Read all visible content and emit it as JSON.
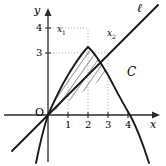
{
  "figure": {
    "type": "analytic-geometry-diagram"
  },
  "axes": {
    "x_axis_label": "x",
    "y_axis_label": "y",
    "origin_label": "O",
    "x_ticks": [
      "1",
      "2",
      "3",
      "4"
    ],
    "y_ticks": [
      "3",
      "4"
    ],
    "x_range": [
      -2.5,
      5.5
    ],
    "y_range": [
      -2.5,
      5.5
    ],
    "unit_px": 20,
    "origin_px": [
      48,
      115
    ]
  },
  "curves": [
    {
      "name_label": "C",
      "kind": "parabola",
      "equation": "y = 4x - x^2",
      "vertex": [
        2,
        4
      ],
      "roots": [
        0,
        4
      ],
      "label_pos_px": [
        129,
        72
      ],
      "color": "#1a1a1a"
    },
    {
      "name_label": "ℓ",
      "kind": "line",
      "equation": "y = x",
      "through": [
        [
          0,
          0
        ],
        [
          3,
          3
        ]
      ],
      "label_pos_px": [
        138,
        6
      ],
      "color": "#1a1a1a"
    }
  ],
  "points": [
    {
      "label": "x",
      "sub": "1",
      "value": 0,
      "label_pos_px": [
        57,
        26
      ]
    },
    {
      "label": "x",
      "sub": "2",
      "value": 3,
      "label_pos_px": [
        107,
        30
      ]
    }
  ],
  "shaded_region": {
    "fill_style": "diagonal-hatch",
    "between": [
      "y = 4x - x^2",
      "y = x"
    ],
    "from_x": 0,
    "to_x": 3,
    "hatch_color": "#2b2b2b"
  },
  "guide_lines": {
    "style": "dotted",
    "color": "#b4b4b4",
    "vertical_at_x": [
      1,
      2,
      3
    ],
    "horizontal_at_y": [
      3,
      4
    ]
  },
  "colors": {
    "ink": "#1a1a1a",
    "axis": "#2b2b2b",
    "guide": "#b4b4b4",
    "background": "#ffffff"
  }
}
